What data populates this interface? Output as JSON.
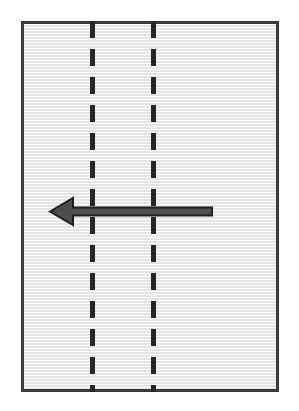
{
  "figure": {
    "canvas": {
      "width": 299,
      "height": 411,
      "background": "#ffffff"
    }
  },
  "road": {
    "name": "road-plate",
    "surface_color": "#efefef",
    "border_color": "#3b3b3b",
    "border_width": 3,
    "x": 21,
    "y": 21,
    "width": 258,
    "height": 371
  },
  "lane_dividers": [
    {
      "id": "lane-divider-left",
      "label": "Left dashed lane line",
      "x": 90,
      "width": 5,
      "color": "#262626",
      "dash_length": 17,
      "gap_length": 11,
      "style": "dashed"
    },
    {
      "id": "lane-divider-right",
      "label": "Right dashed lane line",
      "x": 151,
      "width": 5,
      "color": "#262626",
      "dash_length": 17,
      "gap_length": 11,
      "style": "dashed"
    }
  ],
  "arrow": {
    "id": "direction-arrow",
    "label": "Leftward direction arrow",
    "direction": "left",
    "fill_color": "#4d4d4d",
    "stroke_color": "#1f1f1f",
    "tip_x": 50,
    "tail_x": 212,
    "center_y": 211,
    "shaft_thickness": 8,
    "head_length": 23,
    "head_width": 27
  }
}
